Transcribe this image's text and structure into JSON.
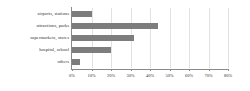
{
  "chart_data": {
    "type": "bar",
    "orientation": "horizontal",
    "title": "",
    "subtitle": "",
    "xlabel": "",
    "ylabel": "",
    "categories": [
      "airports, stations",
      "attractions, parks",
      "supermarkets, stores",
      "hospital, school",
      "others"
    ],
    "values": [
      10,
      44,
      32,
      20,
      4
    ],
    "value_unit": "%",
    "xlim": [
      0,
      80
    ],
    "xticks": [
      0,
      10,
      20,
      30,
      40,
      50,
      60,
      70,
      80
    ],
    "xtick_labels": [
      "0%",
      "10%",
      "20%",
      "30%",
      "40%",
      "50%",
      "60%",
      "70%",
      "80%"
    ],
    "grid": true,
    "grid_axis": "x",
    "legend": false,
    "legend_position": "none",
    "series": [
      {
        "name": "share",
        "values": [
          10,
          44,
          32,
          20,
          4
        ]
      }
    ],
    "colors": {
      "bar": "#7d7d7d",
      "grid": "#e2e2e2",
      "axis": "#8a8a8a",
      "text": "#303030",
      "background": "#ffffff"
    }
  }
}
